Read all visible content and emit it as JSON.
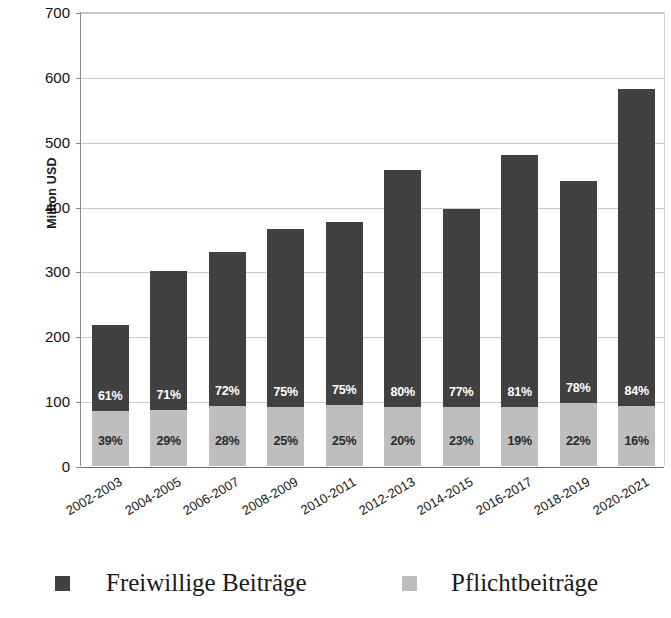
{
  "chart_data": {
    "type": "bar",
    "subtype": "stacked-bar",
    "title": "",
    "xlabel": "",
    "ylabel": "Million USD",
    "ylim": [
      0,
      700
    ],
    "ytick_step": 100,
    "yticks": [
      700,
      600,
      500,
      400,
      300,
      200,
      100,
      0
    ],
    "grid": true,
    "legend_position": "bottom",
    "categories": [
      "2002-2003",
      "2004-2005",
      "2006-2007",
      "2008-2009",
      "2010-2011",
      "2012-2013",
      "2014-2015",
      "2016-2017",
      "2018-2019",
      "2020-2021"
    ],
    "series": [
      {
        "name": "Freiwillige Beiträge",
        "color": "#414141",
        "stack_order": 2,
        "values": [
          133,
          213,
          238,
          274,
          283,
          365,
          305,
          389,
          343,
          489
        ],
        "percent_labels": [
          "61%",
          "71%",
          "72%",
          "75%",
          "75%",
          "80%",
          "77%",
          "81%",
          "78%",
          "84%"
        ]
      },
      {
        "name": "Pflichtbeiträge",
        "color": "#bebebe",
        "stack_order": 1,
        "values": [
          85,
          87,
          92,
          91,
          94,
          91,
          91,
          91,
          97,
          93
        ],
        "percent_labels": [
          "39%",
          "29%",
          "28%",
          "25%",
          "25%",
          "20%",
          "23%",
          "19%",
          "22%",
          "16%"
        ]
      }
    ],
    "totals": [
      218,
      300,
      330,
      365,
      377,
      456,
      396,
      480,
      440,
      582
    ]
  },
  "legend": {
    "entries": [
      {
        "label": "Freiwillige Beiträge",
        "color": "#414141"
      },
      {
        "label": "Pflichtbeiträge",
        "color": "#bebebe"
      }
    ]
  }
}
